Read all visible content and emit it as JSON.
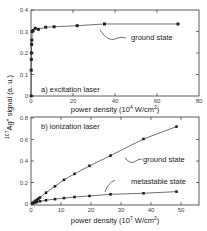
{
  "ylabel": "107Ag+ signal (a. u.)",
  "chart_data": [
    {
      "type": "scatter",
      "panel": "a",
      "title": "a)  excitation laser",
      "xlabel": "power density (10^4 W/cm^2)",
      "ylabel": "107Ag+ signal (a. u.)",
      "xlim": [
        0,
        80
      ],
      "ylim": [
        0,
        0.4
      ],
      "xticks": [
        0,
        20,
        40,
        60,
        80
      ],
      "yticks": [
        0,
        0.1,
        0.2,
        0.3,
        0.4
      ],
      "grid": false,
      "series": [
        {
          "name": "ground state",
          "x": [
            0.05,
            0.1,
            0.15,
            0.2,
            0.3,
            0.4,
            0.6,
            1.0,
            2.0,
            3.5,
            7,
            11,
            22,
            35,
            70
          ],
          "y": [
            0.0,
            0.12,
            0.17,
            0.2,
            0.24,
            0.26,
            0.3,
            0.305,
            0.315,
            0.31,
            0.32,
            0.322,
            0.327,
            0.335,
            0.335
          ]
        }
      ],
      "annotations": [
        {
          "text": "ground state",
          "x": 45,
          "y": 0.3
        }
      ]
    },
    {
      "type": "scatter",
      "panel": "b",
      "title": "b)  ionization laser",
      "xlabel": "power density (10^7 W/cm^2)",
      "ylabel": "107Ag+ signal (a. u.)",
      "xlim": [
        0,
        55
      ],
      "ylim": [
        0,
        0.8
      ],
      "xticks": [
        0,
        10,
        20,
        30,
        40,
        50
      ],
      "yticks": [
        0,
        0.2,
        0.4,
        0.6,
        0.8
      ],
      "grid": false,
      "series": [
        {
          "name": "ground state",
          "x": [
            0.5,
            1,
            1.5,
            2,
            2.5,
            3,
            5,
            8,
            11,
            14.5,
            19.5,
            26.5,
            37.5,
            48.5
          ],
          "y": [
            0.01,
            0.02,
            0.03,
            0.04,
            0.05,
            0.06,
            0.105,
            0.165,
            0.225,
            0.28,
            0.355,
            0.45,
            0.605,
            0.72
          ]
        },
        {
          "name": "metastable state",
          "x": [
            0.5,
            1,
            1.5,
            2,
            3,
            5,
            8,
            11,
            14.5,
            19.5,
            26.5,
            37.5,
            48.5
          ],
          "y": [
            0.005,
            0.01,
            0.015,
            0.02,
            0.025,
            0.035,
            0.045,
            0.055,
            0.065,
            0.075,
            0.09,
            0.1,
            0.115
          ]
        }
      ],
      "annotations": [
        {
          "text": "ground state",
          "x": 30,
          "y": 0.42
        },
        {
          "text": "metastable state",
          "x": 35,
          "y": 0.2
        }
      ]
    }
  ],
  "panel_a": {
    "title": "a)  excitation laser",
    "xlabel_prefix": "power density (10",
    "xlabel_exp": "4",
    "xlabel_unit": " W/cm",
    "xlabel_unit_exp": "2",
    "xlabel_suffix": ")",
    "annotation": "ground state",
    "xticks": [
      "0",
      "20",
      "40",
      "60",
      "80"
    ],
    "yticks": [
      "0",
      "0.1",
      "0.2",
      "0.3",
      "0.4"
    ]
  },
  "panel_b": {
    "title": "b)  ionization laser",
    "xlabel_prefix": "power density (10",
    "xlabel_exp": "7",
    "xlabel_unit": " W/cm",
    "xlabel_unit_exp": "2",
    "xlabel_suffix": ")",
    "annotation_ground": "ground state",
    "annotation_meta": "metastable state",
    "xticks": [
      "0",
      "10",
      "20",
      "30",
      "40",
      "50"
    ],
    "yticks": [
      "0",
      "0.2",
      "0.4",
      "0.6",
      "0.8"
    ]
  },
  "yaxis": {
    "iso": "107",
    "element": "Ag",
    "charge": "+",
    "rest": " signal (a. u.)"
  }
}
